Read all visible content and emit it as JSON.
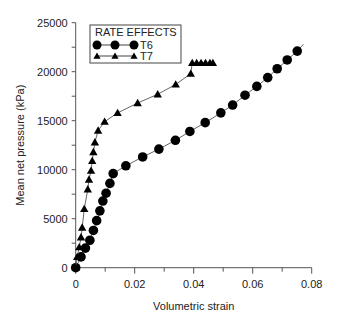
{
  "chart_data": {
    "type": "line",
    "title": "",
    "xlabel": "Volumetric strain",
    "ylabel": "Mean net pressure (kPa)",
    "xlim": [
      0,
      0.08
    ],
    "ylim": [
      0,
      25000
    ],
    "xticks": [
      "0",
      "0.02",
      "0.04",
      "0.06",
      "0.08"
    ],
    "yticks": [
      "0",
      "5000",
      "10000",
      "15000",
      "20000",
      "25000"
    ],
    "grid": false,
    "legend": {
      "title": "RATE EFFECTS",
      "position": "upper left",
      "entries": [
        "T6",
        "T7"
      ]
    },
    "series": [
      {
        "name": "T6",
        "marker": "circle",
        "x": [
          0,
          0.0018,
          0.0033,
          0.0048,
          0.006,
          0.0071,
          0.0082,
          0.0092,
          0.0103,
          0.0116,
          0.0127,
          0.017,
          0.0227,
          0.0282,
          0.0338,
          0.0387,
          0.0439,
          0.0492,
          0.0532,
          0.0574,
          0.0614,
          0.0651,
          0.0683,
          0.0717,
          0.0751
        ],
        "y": [
          0,
          1100,
          2000,
          2800,
          3800,
          4800,
          5800,
          6800,
          7600,
          8600,
          9600,
          10400,
          11300,
          12100,
          13000,
          13900,
          14800,
          15800,
          16600,
          17600,
          18500,
          19400,
          20300,
          21200,
          22100
        ]
      },
      {
        "name": "T7",
        "marker": "triangle",
        "x": [
          0,
          0.0005,
          0.0012,
          0.0018,
          0.0022,
          0.0029,
          0.0041,
          0.0045,
          0.0052,
          0.0056,
          0.006,
          0.0065,
          0.0076,
          0.0098,
          0.0142,
          0.021,
          0.0278,
          0.0339,
          0.039,
          0.0395,
          0.041,
          0.0425,
          0.044,
          0.0455,
          0.0465
        ],
        "y": [
          0,
          1100,
          2100,
          3100,
          4100,
          6000,
          8000,
          9000,
          9900,
          10900,
          11800,
          12800,
          14000,
          14900,
          15800,
          16800,
          17700,
          18700,
          19800,
          20900,
          20900,
          20900,
          20900,
          20900,
          20900
        ]
      }
    ]
  }
}
